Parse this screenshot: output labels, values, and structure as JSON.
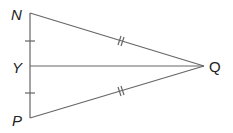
{
  "diagram": {
    "type": "geometry-triangle",
    "points": {
      "N": {
        "label": "N",
        "x": 30,
        "y": 13
      },
      "Y": {
        "label": "Y",
        "x": 30,
        "y": 66
      },
      "P": {
        "label": "P",
        "x": 30,
        "y": 118
      },
      "Q": {
        "label": "Q",
        "x": 204,
        "y": 66
      }
    },
    "segments": [
      "NP",
      "NQ",
      "PQ",
      "YQ"
    ],
    "equal_marks": {
      "single_tick": [
        "NY",
        "YP"
      ],
      "double_tick": [
        "NQ",
        "PQ"
      ]
    },
    "line_color": "#666666",
    "label_color": "#222222"
  }
}
